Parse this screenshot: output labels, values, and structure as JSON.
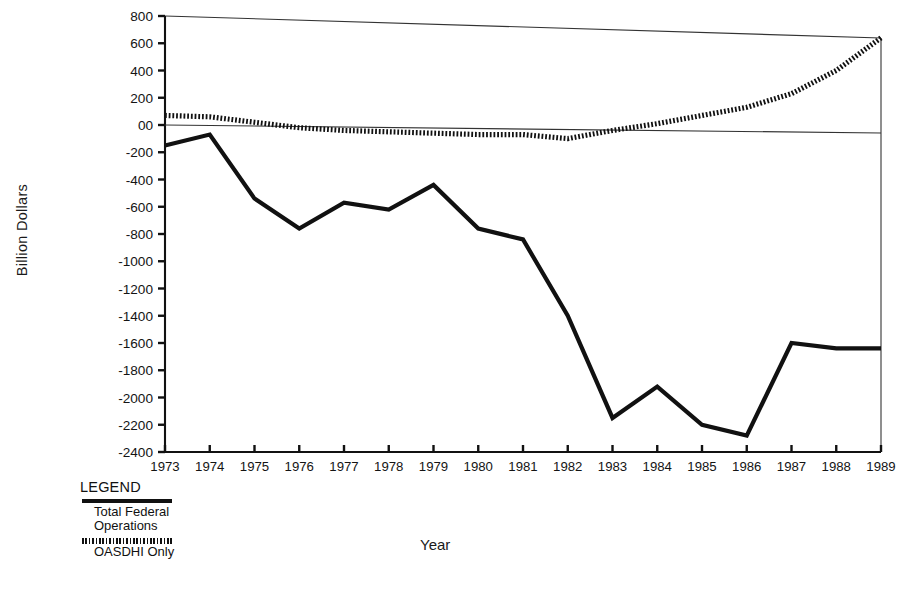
{
  "chart_data": {
    "type": "line",
    "title": "",
    "xlabel": "Year",
    "ylabel": "Billion Dollars",
    "x": [
      1973,
      1974,
      1975,
      1976,
      1977,
      1978,
      1979,
      1980,
      1981,
      1982,
      1983,
      1984,
      1985,
      1986,
      1987,
      1988,
      1989
    ],
    "xtick_labels": [
      "1973",
      "1974",
      "1975",
      "1976",
      "1977",
      "1978",
      "1979",
      "1980",
      "1981",
      "1982",
      "1983",
      "1984",
      "1985",
      "1986",
      "1987",
      "1988",
      "1989"
    ],
    "ytick_labels": [
      "800",
      "600",
      "400",
      "200",
      "00",
      "-200",
      "-400",
      "-600",
      "-800",
      "-1000",
      "-1200",
      "-1400",
      "-1600",
      "-1800",
      "-2000",
      "-2200",
      "-2400"
    ],
    "ytick_values": [
      800,
      600,
      400,
      200,
      0,
      -200,
      -400,
      -600,
      -800,
      -1000,
      -1200,
      -1400,
      -1600,
      -1800,
      -2000,
      -2200,
      -2400
    ],
    "ylim": [
      -2400,
      800
    ],
    "xlim": [
      1973,
      1989
    ],
    "grid": false,
    "legend_position": "below-left",
    "series": [
      {
        "name": "Total Federal Operations",
        "style": "solid",
        "color": "#111111",
        "values": [
          -150,
          -70,
          -540,
          -760,
          -570,
          -620,
          -440,
          -760,
          -840,
          -1400,
          -2150,
          -1920,
          -2200,
          -2280,
          -1600,
          -1640,
          -1640
        ]
      },
      {
        "name": "OASDHI Only",
        "style": "dotted",
        "color": "#111111",
        "values": [
          70,
          60,
          20,
          -20,
          -40,
          -50,
          -60,
          -70,
          -70,
          -100,
          -40,
          10,
          70,
          130,
          230,
          400,
          640
        ]
      }
    ]
  },
  "legend": {
    "title": "LEGEND",
    "entries": [
      {
        "label_line1": "Total Federal",
        "label_line2": "Operations",
        "style": "solid"
      },
      {
        "label_line1": "OASDHI Only",
        "label_line2": "",
        "style": "dotted"
      }
    ]
  },
  "axes": {
    "ylabel": "Billion Dollars",
    "xlabel": "Year"
  },
  "colors": {
    "ink": "#111111",
    "background": "#ffffff"
  }
}
